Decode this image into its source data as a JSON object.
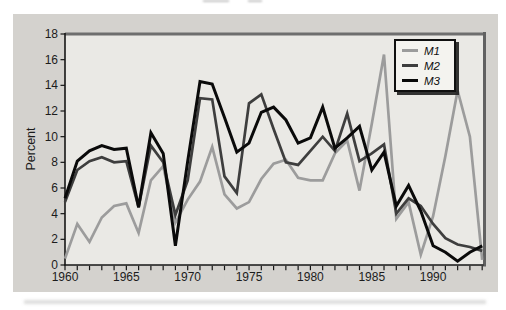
{
  "figure": {
    "ylabel": "Percent",
    "page_background": "#ffffff",
    "panel_background": "#d4d2ce",
    "plot_background": "#eae9e5",
    "frame_color": "#6e6e6e",
    "axis_color": "#161616",
    "label_color": "#1c1c1c"
  },
  "legend": {
    "background": "#f4f3ef",
    "border_color": "#101010",
    "position": "top-right"
  },
  "chart_data": {
    "type": "line",
    "title": "",
    "xlabel": "",
    "ylabel": "Percent",
    "xlim": [
      1960,
      1994
    ],
    "ylim": [
      0,
      18
    ],
    "grid": false,
    "legend_position": "top-right",
    "x": [
      1960,
      1961,
      1962,
      1963,
      1964,
      1965,
      1966,
      1967,
      1968,
      1969,
      1970,
      1971,
      1972,
      1973,
      1974,
      1975,
      1976,
      1977,
      1978,
      1979,
      1980,
      1981,
      1982,
      1983,
      1984,
      1985,
      1986,
      1987,
      1988,
      1989,
      1990,
      1991,
      1992,
      1993,
      1994
    ],
    "x_tick_years": [
      1960,
      1965,
      1970,
      1975,
      1980,
      1985,
      1990
    ],
    "x_tick_labels": [
      "1960",
      "1965",
      "1970",
      "1975",
      "1980",
      "1985",
      "1990"
    ],
    "y_ticks": [
      0,
      2,
      4,
      6,
      8,
      10,
      12,
      14,
      16,
      18
    ],
    "y_tick_labels": [
      "0",
      "2",
      "4",
      "6",
      "8",
      "10",
      "12",
      "14",
      "16",
      "18"
    ],
    "series": [
      {
        "name": "M1",
        "color": "#9c9c9c",
        "values": [
          0.5,
          3.2,
          1.8,
          3.7,
          4.6,
          4.8,
          2.5,
          6.6,
          7.7,
          3.3,
          5.1,
          6.5,
          9.2,
          5.5,
          4.4,
          4.9,
          6.7,
          7.9,
          8.2,
          6.8,
          6.6,
          6.6,
          8.7,
          9.7,
          5.8,
          11.0,
          16.4,
          3.6,
          4.9,
          0.8,
          3.8,
          8.5,
          13.6,
          10.0,
          0.4
        ]
      },
      {
        "name": "M2",
        "color": "#3e3e3e",
        "values": [
          4.9,
          7.4,
          8.1,
          8.4,
          8.0,
          8.1,
          4.5,
          9.3,
          8.0,
          3.9,
          6.6,
          13.0,
          12.9,
          6.9,
          5.6,
          12.6,
          13.3,
          10.6,
          8.0,
          7.8,
          8.9,
          10.0,
          8.9,
          11.8,
          8.1,
          8.7,
          9.4,
          4.0,
          5.2,
          4.6,
          3.2,
          2.1,
          1.6,
          1.4,
          1.1
        ]
      },
      {
        "name": "M3",
        "color": "#0a0a0a",
        "values": [
          5.2,
          8.1,
          8.9,
          9.3,
          9.0,
          9.1,
          4.5,
          10.3,
          8.7,
          1.5,
          8.1,
          14.3,
          14.1,
          11.5,
          8.8,
          9.5,
          11.9,
          12.3,
          11.3,
          9.5,
          9.9,
          12.3,
          9.1,
          9.9,
          10.8,
          7.4,
          8.8,
          4.6,
          6.2,
          4.2,
          1.5,
          1.0,
          0.3,
          1.0,
          1.5
        ]
      }
    ]
  }
}
